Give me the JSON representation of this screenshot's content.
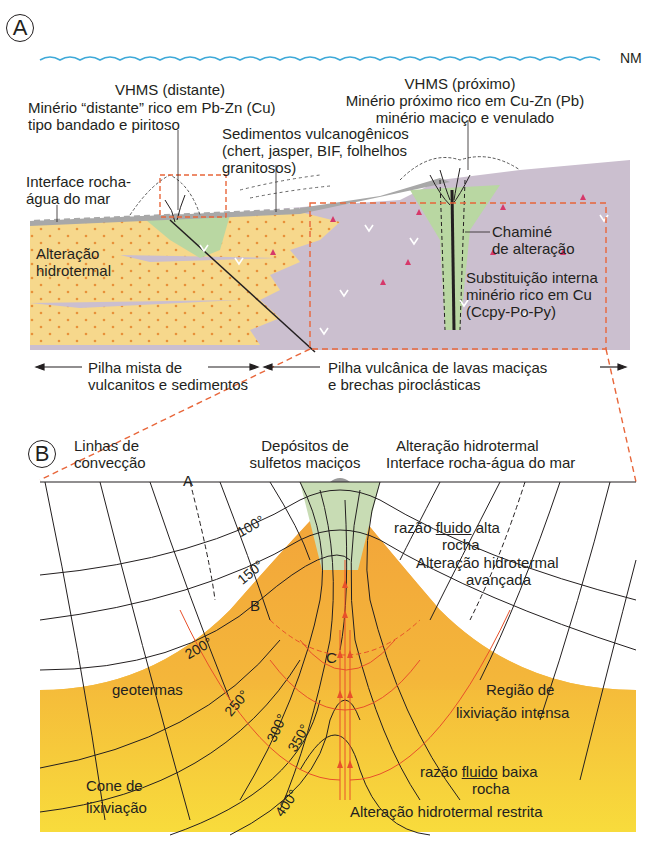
{
  "panel_a": {
    "letter": "A",
    "sea_level_label": "NM",
    "vhms_distal": {
      "title": "VHMS (distante)",
      "line1": "Minério “distante” rico em Pb-Zn (Cu)",
      "line2": "tipo bandado e piritoso"
    },
    "vhms_proximal": {
      "title": "VHMS (próximo)",
      "line1": "Minério próximo rico em Cu-Zn (Pb)",
      "line2": "minério maciço e venulado"
    },
    "sediments": {
      "line1": "Sedimentos vulcanogênicos",
      "line2": "(chert, jasper, BIF, folhelhos",
      "line3": "granitosos)"
    },
    "interface": {
      "line1": "Interface rocha-",
      "line2": "água do mar"
    },
    "alteration": {
      "line1": "Alteração",
      "line2": "hidrotermal"
    },
    "chimney": {
      "line1": "Chaminé",
      "line2": "de alteração"
    },
    "replacement": {
      "line1": "Substituição interna",
      "line2": "minério rico em Cu",
      "line3": "(Ccpy-Po-Py)"
    },
    "mixed_pile": {
      "line1": "Pilha mista de",
      "line2": "vulcanitos e sedimentos"
    },
    "volcanic_pile": {
      "line1": "Pilha vulcânica de lavas maciças",
      "line2": "e brechas piroclásticas"
    },
    "colors": {
      "sea": "#3fa9d8",
      "sediment": "#f6d88c",
      "sediment_dot": "#e8913a",
      "volcanic": "#cbbfcf",
      "alteration": "#b9d7a2",
      "dashed_box": "#e8663a",
      "triangle": "#d6386a"
    }
  },
  "panel_b": {
    "letter": "B",
    "convection": {
      "line1": "Linhas de",
      "line2": "convecção"
    },
    "massive_sulfides": {
      "line1": "Depósitos de",
      "line2": "sulfetos maciços"
    },
    "hydrothermal_interface": {
      "line1": "Alteração hidrotermal",
      "line2": "Interface rocha-água do mar"
    },
    "high_ratio": {
      "prefix": "razão",
      "fluid": "fluido",
      "suffix": "alta",
      "rock": "rocha"
    },
    "advanced": {
      "line1": "Alteração hidrotermal",
      "line2": "avançada"
    },
    "geotherms_label": "geotermas",
    "intense_leaching": {
      "line1": "Região de",
      "line2": "lixiviação intensa"
    },
    "low_ratio": {
      "prefix": "razão",
      "fluid": "fluido",
      "suffix": "baixa",
      "rock": "rocha"
    },
    "leaching_cone": {
      "line1": "Cone de",
      "line2": "lixiviação"
    },
    "restricted": "Alteração hidrotermal restrita",
    "points": [
      "A",
      "B",
      "C"
    ],
    "isotherms": [
      "100°",
      "150°",
      "200°",
      "250°",
      "300°",
      "350°",
      "400°"
    ],
    "colors": {
      "deep_yellow": "#f7d23a",
      "orange": "#f2a23a",
      "green_halo": "#c8dcb4",
      "flow_red": "#e8502a"
    }
  }
}
